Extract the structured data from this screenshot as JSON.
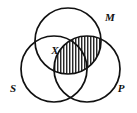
{
  "diagram": {
    "kind": "venn-diagram",
    "background_color": "#ffffff",
    "stroke_color": "#111111",
    "hatch_color": "#111111",
    "width": 137,
    "height": 113,
    "circles": [
      {
        "id": "M",
        "label": "M",
        "cx": 68,
        "cy": 41,
        "r": 33,
        "label_x": 110,
        "label_y": 21
      },
      {
        "id": "S",
        "label": "S",
        "cx": 54,
        "cy": 69,
        "r": 33,
        "label_x": 13,
        "label_y": 92
      },
      {
        "id": "P",
        "label": "P",
        "cx": 87,
        "cy": 69,
        "r": 33,
        "label_x": 121,
        "label_y": 92
      }
    ],
    "markers": [
      {
        "id": "x-marker",
        "label": "X",
        "region": "S and M",
        "x": 55,
        "y": 54
      }
    ],
    "shaded_regions": [
      {
        "id": "m-p-shading",
        "region": "M and P",
        "pattern": "vertical-hatch",
        "pattern_spacing": 3
      }
    ]
  }
}
